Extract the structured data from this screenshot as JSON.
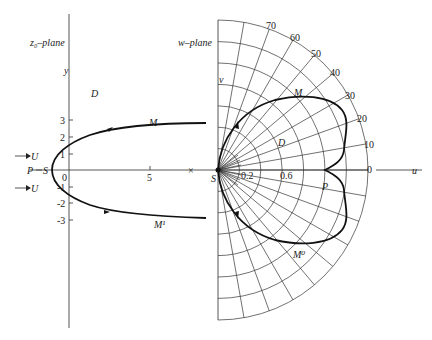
{
  "left_panel": {
    "title": "z₀–plane",
    "y_axis_label": "y",
    "region_label": "D",
    "upper_curve_label": "M",
    "lower_curve_label": "M¹",
    "point_P": "P",
    "point_S_left": "S",
    "stagnation_S_right": "S",
    "flow_label_upper": "U",
    "flow_label_lower": "U",
    "x_ticks": [
      "0",
      "5"
    ],
    "y_ticks": [
      "3",
      "2",
      "1",
      "-1",
      "-2",
      "-3"
    ],
    "singularity_mark": "×"
  },
  "right_panel": {
    "title": "w–plane",
    "v_axis_label": "v",
    "u_axis_label": "u",
    "region_label": "D",
    "upper_curve_label": "M",
    "lower_curve_label": "M⁰",
    "point_P": "P",
    "radius_labels": [
      "0.2",
      "0.6"
    ],
    "angle_labels": [
      "0",
      "10",
      "20",
      "30",
      "40",
      "50",
      "60",
      "70"
    ]
  },
  "colors": {
    "line": "#333333",
    "curve": "#111111",
    "background": "#ffffff"
  }
}
